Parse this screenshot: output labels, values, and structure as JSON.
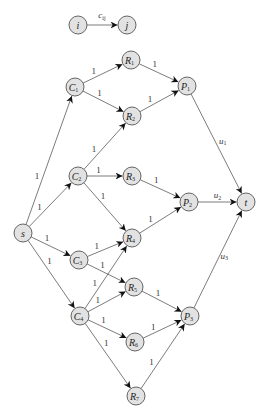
{
  "legend": {
    "from": {
      "label": "i",
      "sub": ""
    },
    "to": {
      "label": "j",
      "sub": ""
    },
    "edge_label": "c",
    "edge_sub": "ij"
  },
  "nodes": [
    {
      "id": "s",
      "label": "s",
      "sub": "",
      "x": 23,
      "y": 233
    },
    {
      "id": "C1",
      "label": "C",
      "sub": "1",
      "x": 75,
      "y": 87
    },
    {
      "id": "C2",
      "label": "C",
      "sub": "2",
      "x": 78,
      "y": 176
    },
    {
      "id": "C3",
      "label": "C",
      "sub": "3",
      "x": 79,
      "y": 260
    },
    {
      "id": "C4",
      "label": "C",
      "sub": "4",
      "x": 80,
      "y": 316
    },
    {
      "id": "R1",
      "label": "R",
      "sub": "1",
      "x": 131,
      "y": 60
    },
    {
      "id": "R2",
      "label": "R",
      "sub": "2",
      "x": 132,
      "y": 116
    },
    {
      "id": "R3",
      "label": "R",
      "sub": "3",
      "x": 132,
      "y": 176
    },
    {
      "id": "R4",
      "label": "R",
      "sub": "4",
      "x": 132,
      "y": 238
    },
    {
      "id": "R5",
      "label": "R",
      "sub": "5",
      "x": 134,
      "y": 287
    },
    {
      "id": "R6",
      "label": "R",
      "sub": "6",
      "x": 135,
      "y": 342
    },
    {
      "id": "R7",
      "label": "R",
      "sub": "7",
      "x": 136,
      "y": 396
    },
    {
      "id": "P1",
      "label": "P",
      "sub": "1",
      "x": 187,
      "y": 86
    },
    {
      "id": "P2",
      "label": "P",
      "sub": "2",
      "x": 189,
      "y": 202
    },
    {
      "id": "P3",
      "label": "P",
      "sub": "3",
      "x": 190,
      "y": 316
    },
    {
      "id": "t",
      "label": "t",
      "sub": "",
      "x": 246,
      "y": 202
    }
  ],
  "edges": [
    {
      "from": "s",
      "to": "C1",
      "label": "1"
    },
    {
      "from": "s",
      "to": "C2",
      "label": "1"
    },
    {
      "from": "s",
      "to": "C3",
      "label": "1"
    },
    {
      "from": "s",
      "to": "C4",
      "label": "1"
    },
    {
      "from": "C1",
      "to": "R1",
      "label": "1"
    },
    {
      "from": "C1",
      "to": "R2",
      "label": "1"
    },
    {
      "from": "C2",
      "to": "R2",
      "label": "1"
    },
    {
      "from": "C2",
      "to": "R3",
      "label": "1"
    },
    {
      "from": "C2",
      "to": "R4",
      "label": "1"
    },
    {
      "from": "C3",
      "to": "R4",
      "label": "1"
    },
    {
      "from": "C3",
      "to": "R5",
      "label": "1"
    },
    {
      "from": "C4",
      "to": "R4",
      "label": "1"
    },
    {
      "from": "C4",
      "to": "R5",
      "label": "1"
    },
    {
      "from": "C4",
      "to": "R6",
      "label": "1"
    },
    {
      "from": "C4",
      "to": "R7",
      "label": "1"
    },
    {
      "from": "R1",
      "to": "P1",
      "label": "1"
    },
    {
      "from": "R2",
      "to": "P1",
      "label": "1"
    },
    {
      "from": "R3",
      "to": "P2",
      "label": "1"
    },
    {
      "from": "R4",
      "to": "P2",
      "label": "1"
    },
    {
      "from": "R5",
      "to": "P3",
      "label": "1"
    },
    {
      "from": "R6",
      "to": "P3",
      "label": "1"
    },
    {
      "from": "R7",
      "to": "P3",
      "label": "1"
    },
    {
      "from": "P1",
      "to": "t",
      "label": "u",
      "sub": "1"
    },
    {
      "from": "P2",
      "to": "t",
      "label": "u",
      "sub": "2"
    },
    {
      "from": "P3",
      "to": "t",
      "label": "u",
      "sub": "3"
    }
  ]
}
